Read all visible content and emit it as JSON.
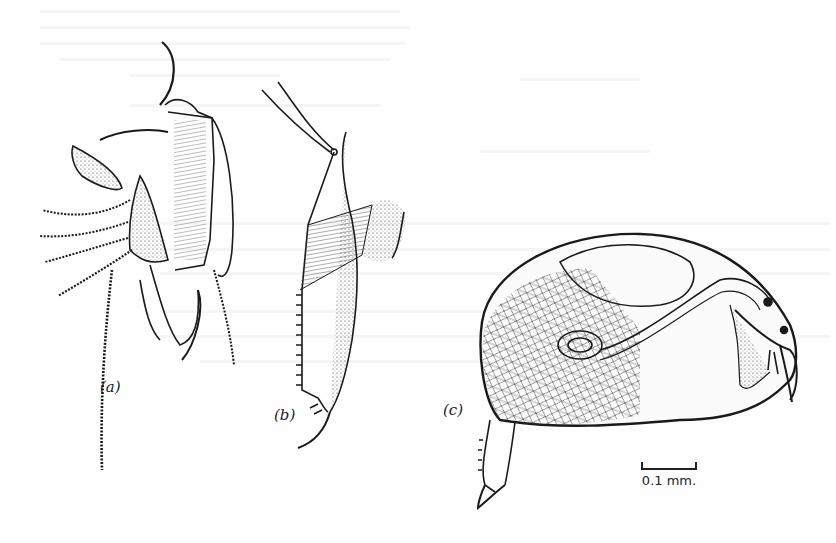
{
  "figure": {
    "panels": [
      {
        "id": "a",
        "label": "(a)"
      },
      {
        "id": "b",
        "label": "(b)"
      },
      {
        "id": "c",
        "label": "(c)"
      }
    ],
    "scale_bar": {
      "label": "0.1 mm."
    }
  },
  "colors": {
    "ink": "#222222",
    "paper": "#fefefe"
  }
}
